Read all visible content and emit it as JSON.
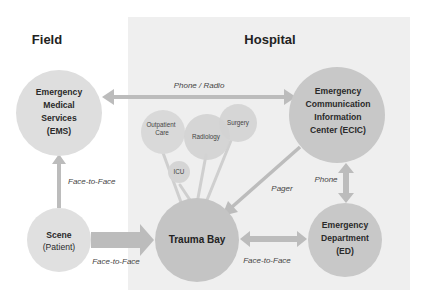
{
  "regions": {
    "field": {
      "label": "Field"
    },
    "hospital": {
      "label": "Hospital"
    }
  },
  "nodes": {
    "ems": {
      "lines": [
        "Emergency",
        "Medical",
        "Services",
        "(EMS)"
      ]
    },
    "ecic": {
      "lines": [
        "Emergency",
        "Communication",
        "Information",
        "Center (ECIC)"
      ]
    },
    "scene": {
      "lines": [
        "Scene",
        "(Patient)"
      ]
    },
    "trauma_bay": {
      "label": "Trauma Bay"
    },
    "ed": {
      "lines": [
        "Emergency",
        "Department",
        "(ED)"
      ]
    },
    "outpatient": {
      "lines": [
        "Outpatient",
        "Care"
      ]
    },
    "radiology": {
      "label": "Radiology"
    },
    "surgery": {
      "label": "Surgery"
    },
    "icu": {
      "label": "ICU"
    }
  },
  "edges": {
    "ems_ecic": {
      "label": "Phone / Radio"
    },
    "scene_ems": {
      "label": "Face-to-Face"
    },
    "scene_trauma": {
      "label": "Face-to-Face"
    },
    "trauma_ed": {
      "label": "Face-to-Face"
    },
    "ecic_trauma": {
      "label": "Pager"
    },
    "ecic_ed": {
      "label": "Phone"
    }
  },
  "colors": {
    "hospital_panel": "#efefef",
    "arrow": "#bcbcbc",
    "node_light": "#dedede",
    "node_dark": "#c6c6c6",
    "node_small": "#d9d9d9"
  }
}
